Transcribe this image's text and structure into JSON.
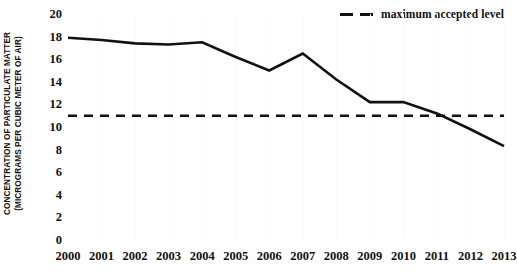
{
  "chart_data": {
    "type": "line",
    "title": "",
    "xlabel": "",
    "ylabel": "CONCENTRATION OF PARTICULATE MATTER (MICROGRAMS PER CUBIC METER OF AIR)",
    "ylabel_lines": [
      "CONCENTRATION OF PARTICULATE MATTER",
      "(MICROGRAMS PER CUBIC METER OF AIR)"
    ],
    "categories": [
      "2000",
      "2001",
      "2002",
      "2003",
      "2004",
      "2005",
      "2006",
      "2007",
      "2008",
      "2009",
      "2010",
      "2011",
      "2012",
      "2013"
    ],
    "x": [
      2000,
      2001,
      2002,
      2003,
      2004,
      2005,
      2006,
      2007,
      2008,
      2009,
      2010,
      2011,
      2012,
      2013
    ],
    "series": [
      {
        "name": "particulate matter concentration",
        "values": [
          17.9,
          17.7,
          17.4,
          17.3,
          17.5,
          16.2,
          15.0,
          16.5,
          14.2,
          12.2,
          12.2,
          11.2,
          9.8,
          8.3
        ],
        "style": "solid",
        "color": "#111111"
      }
    ],
    "reference_lines": [
      {
        "label": "maximum accepted level",
        "value": 11,
        "style": "dashed",
        "color": "#111111"
      }
    ],
    "ylim": [
      0,
      20
    ],
    "yticks": [
      0,
      2,
      4,
      6,
      8,
      10,
      12,
      14,
      16,
      18,
      20
    ],
    "ytick_labels": [
      "0",
      "2",
      "4",
      "6",
      "8",
      "10",
      "12",
      "14",
      "16",
      "18",
      "20"
    ],
    "grid": "vertical-faint",
    "legend_position": "top-right",
    "legend": [
      "maximum accepted level"
    ]
  }
}
